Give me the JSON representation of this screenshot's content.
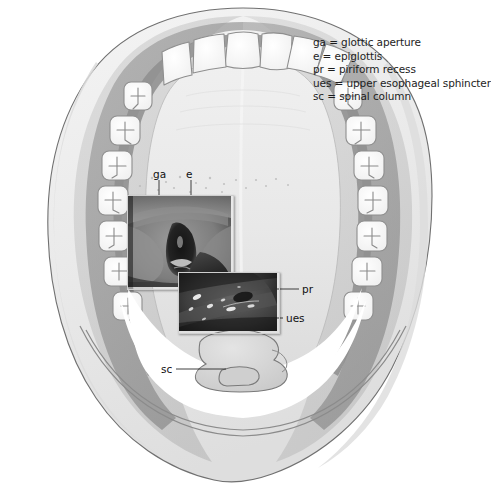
{
  "figure": {
    "type": "medical-illustration",
    "view": "superior axial view of head and oral cavity with endoscopic insets",
    "background_color": "#ffffff"
  },
  "legend": {
    "entries": [
      {
        "abbr": "ga",
        "text": "ga = glottic aperture"
      },
      {
        "abbr": "e",
        "text": "e = epiglottis"
      },
      {
        "abbr": "pr",
        "text": "pr = piriform recess"
      },
      {
        "abbr": "ues",
        "text": "ues = upper esophageal sphincter"
      },
      {
        "abbr": "sc",
        "text": "sc = spinal column"
      }
    ]
  },
  "callouts": {
    "ga": "ga",
    "e": "e",
    "pr": "pr",
    "ues": "ues",
    "sc": "sc"
  },
  "anatomy": {
    "head_outline": "skull and soft tissue silhouette",
    "dental_arcade": "maxillary teeth, incisors anterior, molars posterior",
    "hard_palate": "hard palate",
    "soft_palate": "soft palate with rugae dots",
    "spinal_column": "cervical vertebra"
  },
  "insets": {
    "glottis": "endoscopic view of larynx showing glottic aperture and epiglottis",
    "hypopharynx": "endoscopic view of hypopharynx showing piriform recess and upper esophageal sphincter"
  },
  "colors": {
    "outline": "#6a6a6a",
    "skin_light": "#ececec",
    "tissue_mid": "#bdbdbd",
    "tissue_dark": "#9a9a9a",
    "tooth": "#fdfdfd",
    "palate": "#e6e6e6",
    "text": "#1d1d1d"
  }
}
